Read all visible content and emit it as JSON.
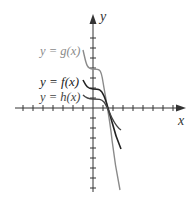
{
  "chart_data": {
    "type": "line",
    "title": "",
    "xlabel": "x",
    "ylabel": "y",
    "grid": false,
    "x_ticks_count_neg": 7,
    "x_ticks_count_pos": 8,
    "y_ticks_count_pos": 7,
    "y_ticks_count_neg": 8,
    "series": [
      {
        "name": "y = g(x)",
        "color": "#8a8a8a",
        "shape": "cubic-like, plateau near y=4, crosses x-axis near x=1.6, steepest descent"
      },
      {
        "name": "y = f(x)",
        "color": "#222222",
        "shape": "cubic-like, plateau near y=2, crosses x-axis near x=1.6"
      },
      {
        "name": "y = h(x)",
        "color": "#444444",
        "shape": "cubic-like, plateau near y=1, crosses x-axis near x=1.6, shallowest descent"
      }
    ]
  },
  "labels": {
    "g": {
      "prefix": "y = ",
      "fn": "g",
      "arg": "(x)"
    },
    "f": {
      "prefix": "y = ",
      "fn": "f",
      "arg": "(x)"
    },
    "h": {
      "prefix": "y = ",
      "fn": "h",
      "arg": "(x)"
    },
    "x_axis": "x",
    "y_axis": "y"
  },
  "colors": {
    "g": "#8a8a8a",
    "f": "#222222",
    "h": "#444444",
    "axis": "#333333"
  }
}
